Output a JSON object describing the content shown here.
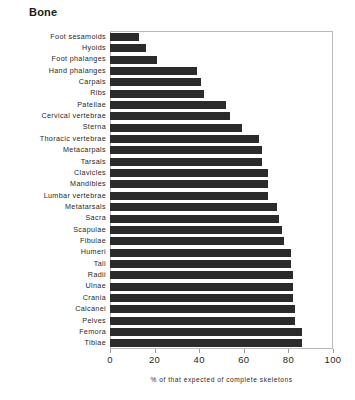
{
  "chart_data": {
    "type": "bar",
    "orientation": "horizontal",
    "title": "Bone",
    "xlabel": "% of that expected of complete skeletons",
    "ylabel": "",
    "xlim": [
      0,
      100
    ],
    "xticks": [
      "0",
      "20",
      "40",
      "60",
      "80",
      "100"
    ],
    "xtick_values": [
      0,
      20,
      40,
      60,
      80,
      100
    ],
    "grid": false,
    "legend": null,
    "bar_color": "#2b2b2b",
    "frame_color": "#b9b9b9",
    "categories": [
      "Foot sesamoids",
      "Hyoids",
      "Foot phalanges",
      "Hand phalanges",
      "Carpals",
      "Ribs",
      "Patellae",
      "Cervical vertebrae",
      "Sterna",
      "Thoracic vertebrae",
      "Metacarpals",
      "Tarsals",
      "Clavicles",
      "Mandibles",
      "Lumbar vertebrae",
      "Metatarsals",
      "Sacra",
      "Scapulae",
      "Fibulae",
      "Humeri",
      "Tali",
      "Radii",
      "Ulnae",
      "Crania",
      "Calcanei",
      "Pelves",
      "Femora",
      "Tibiae"
    ],
    "values": [
      13,
      16,
      21,
      39,
      41,
      42,
      52,
      54,
      59,
      67,
      68,
      68,
      71,
      71,
      71,
      75,
      76,
      77,
      78,
      81,
      81,
      82,
      82,
      82,
      83,
      83,
      86,
      86
    ]
  }
}
